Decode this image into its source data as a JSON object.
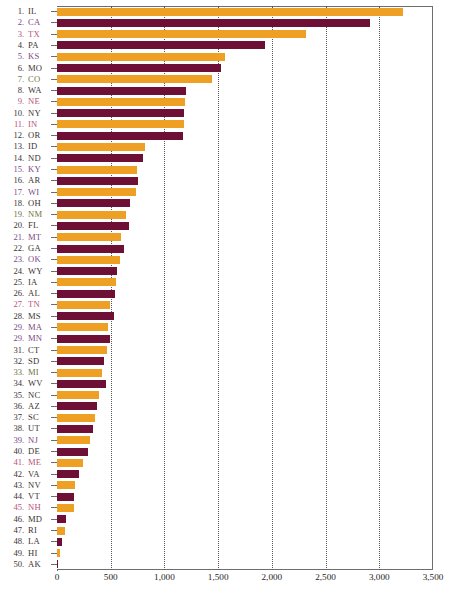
{
  "chart_data": {
    "type": "bar",
    "orientation": "horizontal",
    "title": "",
    "subtitle": "",
    "xlabel": "",
    "ylabel": "",
    "xlim": [
      0,
      3500
    ],
    "ylim": null,
    "grid": true,
    "grid_axis": "x",
    "grid_style": "dotted",
    "legend": null,
    "legend_position": "none",
    "xticks": [
      {
        "value": 0,
        "label": "0"
      },
      {
        "value": 500,
        "label": "500"
      },
      {
        "value": 1000,
        "label": "1,000"
      },
      {
        "value": 1500,
        "label": "1,500"
      },
      {
        "value": 2000,
        "label": "2,000"
      },
      {
        "value": 2500,
        "label": "2,500"
      },
      {
        "value": 3000,
        "label": "3,000"
      },
      {
        "value": 3500,
        "label": "3,500"
      }
    ],
    "colors": {
      "bar_orange": "#eda024",
      "bar_maroon": "#6e0f36",
      "axis": "#6d6d6d",
      "grid": "#555555",
      "label_dark": "#3c3431",
      "label_plum": "#7d4a86",
      "label_rose": "#b8547c",
      "label_olive": "#6f7442",
      "label_teal": "#4b7d7a"
    },
    "categories": [
      "IL",
      "CA",
      "TX",
      "PA",
      "KS",
      "MO",
      "CO",
      "WA",
      "NE",
      "NY",
      "IN",
      "OR",
      "ID",
      "ND",
      "KY",
      "AR",
      "WI",
      "OH",
      "NM",
      "FL",
      "MT",
      "GA",
      "OK",
      "WY",
      "IA",
      "AL",
      "TN",
      "MS",
      "MA",
      "MN",
      "CT",
      "SD",
      "MI",
      "WV",
      "NC",
      "AZ",
      "SC",
      "UT",
      "NJ",
      "DE",
      "ME",
      "VA",
      "NV",
      "VT",
      "NH",
      "MD",
      "RI",
      "LA",
      "HI",
      "AK"
    ],
    "values": [
      3220,
      2915,
      2320,
      1935,
      1565,
      1530,
      1445,
      1200,
      1195,
      1185,
      1180,
      1175,
      820,
      800,
      745,
      755,
      735,
      680,
      645,
      670,
      595,
      625,
      585,
      560,
      550,
      540,
      495,
      530,
      475,
      495,
      465,
      440,
      420,
      455,
      395,
      375,
      350,
      335,
      305,
      285,
      245,
      205,
      170,
      160,
      155,
      85,
      75,
      45,
      25,
      10
    ],
    "rows": [
      {
        "rank": "1.",
        "abbr": "IL",
        "value": 3220,
        "color": "bar_orange",
        "label_color": "label_dark"
      },
      {
        "rank": "2.",
        "abbr": "CA",
        "value": 2915,
        "color": "bar_maroon",
        "label_color": "label_plum"
      },
      {
        "rank": "3.",
        "abbr": "TX",
        "value": 2320,
        "color": "bar_orange",
        "label_color": "label_rose"
      },
      {
        "rank": "4.",
        "abbr": "PA",
        "value": 1935,
        "color": "bar_maroon",
        "label_color": "label_dark"
      },
      {
        "rank": "5.",
        "abbr": "KS",
        "value": 1565,
        "color": "bar_orange",
        "label_color": "label_plum"
      },
      {
        "rank": "6.",
        "abbr": "MO",
        "value": 1530,
        "color": "bar_maroon",
        "label_color": "label_dark"
      },
      {
        "rank": "7.",
        "abbr": "CO",
        "value": 1445,
        "color": "bar_orange",
        "label_color": "label_olive"
      },
      {
        "rank": "8.",
        "abbr": "WA",
        "value": 1200,
        "color": "bar_maroon",
        "label_color": "label_dark"
      },
      {
        "rank": "9.",
        "abbr": "NE",
        "value": 1195,
        "color": "bar_orange",
        "label_color": "label_rose"
      },
      {
        "rank": "10.",
        "abbr": "NY",
        "value": 1185,
        "color": "bar_maroon",
        "label_color": "label_dark"
      },
      {
        "rank": "11.",
        "abbr": "IN",
        "value": 1180,
        "color": "bar_orange",
        "label_color": "label_rose"
      },
      {
        "rank": "12.",
        "abbr": "OR",
        "value": 1175,
        "color": "bar_maroon",
        "label_color": "label_dark"
      },
      {
        "rank": "13.",
        "abbr": "ID",
        "value": 820,
        "color": "bar_orange",
        "label_color": "label_dark"
      },
      {
        "rank": "14.",
        "abbr": "ND",
        "value": 800,
        "color": "bar_maroon",
        "label_color": "label_dark"
      },
      {
        "rank": "15.",
        "abbr": "KY",
        "value": 745,
        "color": "bar_orange",
        "label_color": "label_plum"
      },
      {
        "rank": "16.",
        "abbr": "AR",
        "value": 755,
        "color": "bar_maroon",
        "label_color": "label_dark"
      },
      {
        "rank": "17.",
        "abbr": "WI",
        "value": 735,
        "color": "bar_orange",
        "label_color": "label_plum"
      },
      {
        "rank": "18.",
        "abbr": "OH",
        "value": 680,
        "color": "bar_maroon",
        "label_color": "label_dark"
      },
      {
        "rank": "19.",
        "abbr": "NM",
        "value": 645,
        "color": "bar_orange",
        "label_color": "label_olive"
      },
      {
        "rank": "20.",
        "abbr": "FL",
        "value": 670,
        "color": "bar_maroon",
        "label_color": "label_dark"
      },
      {
        "rank": "21.",
        "abbr": "MT",
        "value": 595,
        "color": "bar_orange",
        "label_color": "label_plum"
      },
      {
        "rank": "22.",
        "abbr": "GA",
        "value": 625,
        "color": "bar_maroon",
        "label_color": "label_dark"
      },
      {
        "rank": "23.",
        "abbr": "OK",
        "value": 585,
        "color": "bar_orange",
        "label_color": "label_plum"
      },
      {
        "rank": "24.",
        "abbr": "WY",
        "value": 560,
        "color": "bar_maroon",
        "label_color": "label_dark"
      },
      {
        "rank": "25.",
        "abbr": "IA",
        "value": 550,
        "color": "bar_orange",
        "label_color": "label_dark"
      },
      {
        "rank": "26.",
        "abbr": "AL",
        "value": 540,
        "color": "bar_maroon",
        "label_color": "label_dark"
      },
      {
        "rank": "27.",
        "abbr": "TN",
        "value": 495,
        "color": "bar_orange",
        "label_color": "label_rose"
      },
      {
        "rank": "28.",
        "abbr": "MS",
        "value": 530,
        "color": "bar_maroon",
        "label_color": "label_dark"
      },
      {
        "rank": "29.",
        "abbr": "MA",
        "value": 475,
        "color": "bar_orange",
        "label_color": "label_plum"
      },
      {
        "rank": "29.",
        "abbr": "MN",
        "value": 495,
        "color": "bar_maroon",
        "label_color": "label_plum"
      },
      {
        "rank": "31.",
        "abbr": "CT",
        "value": 465,
        "color": "bar_orange",
        "label_color": "label_dark"
      },
      {
        "rank": "32.",
        "abbr": "SD",
        "value": 440,
        "color": "bar_maroon",
        "label_color": "label_dark"
      },
      {
        "rank": "33.",
        "abbr": "MI",
        "value": 420,
        "color": "bar_orange",
        "label_color": "label_olive"
      },
      {
        "rank": "34.",
        "abbr": "WV",
        "value": 455,
        "color": "bar_maroon",
        "label_color": "label_dark"
      },
      {
        "rank": "35.",
        "abbr": "NC",
        "value": 395,
        "color": "bar_orange",
        "label_color": "label_dark"
      },
      {
        "rank": "36.",
        "abbr": "AZ",
        "value": 375,
        "color": "bar_maroon",
        "label_color": "label_dark"
      },
      {
        "rank": "37.",
        "abbr": "SC",
        "value": 350,
        "color": "bar_orange",
        "label_color": "label_dark"
      },
      {
        "rank": "38.",
        "abbr": "UT",
        "value": 335,
        "color": "bar_maroon",
        "label_color": "label_dark"
      },
      {
        "rank": "39.",
        "abbr": "NJ",
        "value": 305,
        "color": "bar_orange",
        "label_color": "label_plum"
      },
      {
        "rank": "40.",
        "abbr": "DE",
        "value": 285,
        "color": "bar_maroon",
        "label_color": "label_dark"
      },
      {
        "rank": "41.",
        "abbr": "ME",
        "value": 245,
        "color": "bar_orange",
        "label_color": "label_rose"
      },
      {
        "rank": "42.",
        "abbr": "VA",
        "value": 205,
        "color": "bar_maroon",
        "label_color": "label_dark"
      },
      {
        "rank": "43.",
        "abbr": "NV",
        "value": 170,
        "color": "bar_orange",
        "label_color": "label_dark"
      },
      {
        "rank": "44.",
        "abbr": "VT",
        "value": 160,
        "color": "bar_maroon",
        "label_color": "label_dark"
      },
      {
        "rank": "45.",
        "abbr": "NH",
        "value": 155,
        "color": "bar_orange",
        "label_color": "label_rose"
      },
      {
        "rank": "46.",
        "abbr": "MD",
        "value": 85,
        "color": "bar_maroon",
        "label_color": "label_dark"
      },
      {
        "rank": "47.",
        "abbr": "RI",
        "value": 75,
        "color": "bar_orange",
        "label_color": "label_dark"
      },
      {
        "rank": "48.",
        "abbr": "LA",
        "value": 45,
        "color": "bar_maroon",
        "label_color": "label_dark"
      },
      {
        "rank": "49.",
        "abbr": "HI",
        "value": 25,
        "color": "bar_orange",
        "label_color": "label_dark"
      },
      {
        "rank": "50.",
        "abbr": "AK",
        "value": 10,
        "color": "bar_maroon",
        "label_color": "label_dark"
      }
    ]
  }
}
